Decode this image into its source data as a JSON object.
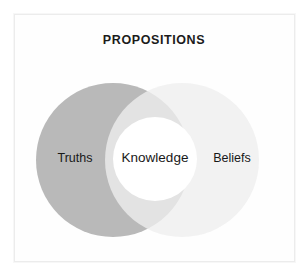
{
  "figure": {
    "title": "PROPOSITIONS",
    "background_color": "#ffffff",
    "frame_color": "#ececec"
  },
  "chart_data": {
    "type": "venn",
    "title": "PROPOSITIONS",
    "xlabel": "",
    "ylabel": "",
    "legend_position": "none",
    "grid": false,
    "sets": [
      {
        "name": "left-set",
        "label": "Truths",
        "color": "#b9b9b9",
        "center_x": 113,
        "center_y": 160,
        "radius": 77
      },
      {
        "name": "right-set",
        "label": "Beliefs",
        "color": "#eeeeee",
        "center_x": 182,
        "center_y": 160,
        "radius": 77
      }
    ],
    "intersection": {
      "label": "Knowledge",
      "color": "#dcdcdc",
      "inner_circle_color": "#ffffff",
      "inner_center_x": 155,
      "inner_center_y": 159,
      "inner_radius": 42
    },
    "labels": [
      "Truths",
      "Knowledge",
      "Beliefs"
    ]
  },
  "labels": {
    "left": "Truths",
    "center": "Knowledge",
    "right": "Beliefs"
  }
}
